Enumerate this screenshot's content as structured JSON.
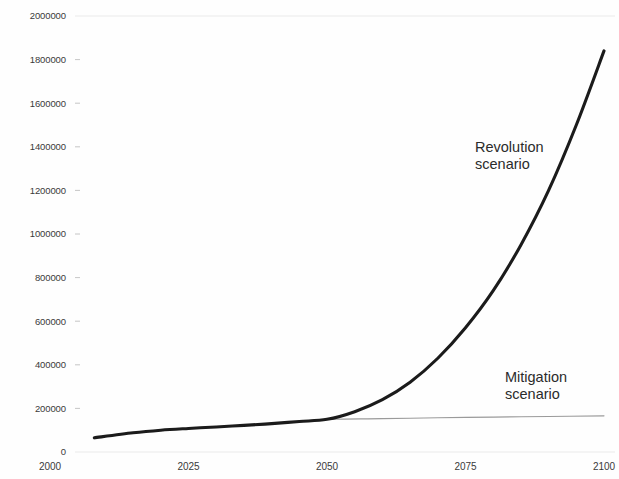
{
  "chart_data": {
    "type": "line",
    "title": "",
    "subtitle": "",
    "xlabel": "",
    "ylabel": "",
    "xlim": [
      2000,
      2100
    ],
    "ylim": [
      0,
      2000000
    ],
    "grid": true,
    "legend_position": "inline-annotation",
    "x_ticks": [
      "2000",
      "2025",
      "2050",
      "2075",
      "2100"
    ],
    "x_tick_values": [
      2000,
      2025,
      2050,
      2075,
      2100
    ],
    "y_ticks": [
      "0",
      "200000",
      "400000",
      "600000",
      "800000",
      "1000000",
      "1200000",
      "1400000",
      "1600000",
      "1800000",
      "2000000"
    ],
    "y_tick_values": [
      0,
      200000,
      400000,
      600000,
      800000,
      1000000,
      1200000,
      1400000,
      1600000,
      1800000,
      2000000
    ],
    "series": [
      {
        "name": "Revolution scenario",
        "color": "#1b1b1b",
        "x": [
          2008,
          2015,
          2020,
          2025,
          2030,
          2035,
          2040,
          2045,
          2050,
          2055,
          2060,
          2065,
          2070,
          2075,
          2080,
          2085,
          2090,
          2095,
          2100
        ],
        "values": [
          65000,
          88000,
          100000,
          108000,
          115000,
          122000,
          130000,
          140000,
          150000,
          185000,
          240000,
          320000,
          430000,
          570000,
          740000,
          950000,
          1200000,
          1500000,
          1840000
        ]
      },
      {
        "name": "Mitigation scenario",
        "color": "#9a9a9a",
        "x": [
          2008,
          2015,
          2020,
          2025,
          2030,
          2035,
          2040,
          2045,
          2050,
          2060,
          2070,
          2080,
          2090,
          2100
        ],
        "values": [
          65000,
          88000,
          100000,
          108000,
          115000,
          122000,
          130000,
          140000,
          150000,
          153000,
          157000,
          160000,
          163000,
          166000
        ]
      }
    ],
    "annotations": [
      {
        "id": "revolution-label",
        "line1": "Revolution",
        "line2": "scenario",
        "x_px": 475,
        "y_px": 152
      },
      {
        "id": "mitigation-label",
        "line1": "Mitigation",
        "line2": "scenario",
        "x_px": 505,
        "y_px": 382
      }
    ]
  },
  "colors": {
    "revolution": "#1b1b1b",
    "mitigation": "#9a9a9a",
    "grid": "#d8d8d8",
    "text": "#3a3a3a",
    "background": "#fefefe"
  }
}
